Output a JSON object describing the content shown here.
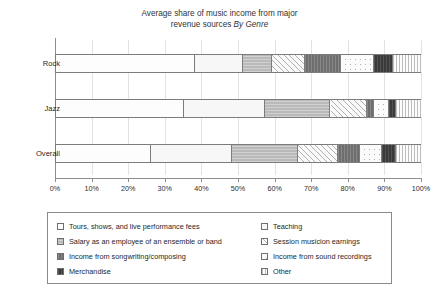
{
  "chart_data": {
    "type": "bar",
    "orientation": "horizontal",
    "stacked": true,
    "normalized_percent": true,
    "title_line1": "Average share of music income from major",
    "title_line2_plain": "revenue sources ",
    "title_line2_italic": "By Genre",
    "xlabel": "",
    "ylabel": "",
    "xlim": [
      0,
      100
    ],
    "xticks": [
      "0%",
      "10%",
      "20%",
      "30%",
      "40%",
      "50%",
      "60%",
      "70%",
      "80%",
      "90%",
      "100%"
    ],
    "xtick_values": [
      0,
      10,
      20,
      30,
      40,
      50,
      60,
      70,
      80,
      90,
      100
    ],
    "grid": true,
    "legend_position": "bottom",
    "categories": [
      "Rock",
      "Jazz",
      "Overall"
    ],
    "series": [
      {
        "name": "Tours, shows, and live performance fees",
        "pattern": "p-white",
        "values": [
          38,
          35,
          26
        ]
      },
      {
        "name": "Teaching",
        "pattern": "p-dots-light",
        "values": [
          13,
          22,
          22
        ]
      },
      {
        "name": "Salary as an employee of an ensemble or band",
        "pattern": "p-gray-mid",
        "values": [
          8,
          18,
          18
        ]
      },
      {
        "name": "Session musicion earnings",
        "pattern": "p-diag",
        "values": [
          9,
          10,
          11
        ]
      },
      {
        "name": "Income from songwriting/composing",
        "pattern": "p-darkgray",
        "values": [
          10,
          2,
          6
        ]
      },
      {
        "name": "Income from sound recordings",
        "pattern": "p-dots-white",
        "values": [
          9,
          4,
          6
        ]
      },
      {
        "name": "Merchandise",
        "pattern": "p-black",
        "values": [
          5,
          2,
          4
        ]
      },
      {
        "name": "Other",
        "pattern": "p-vlines",
        "values": [
          8,
          7,
          7
        ]
      }
    ]
  },
  "legend": {
    "left_column": [
      {
        "label": "Tours, shows, and live performance fees",
        "pattern": "p-white"
      },
      {
        "label": "Salary as an employee of an ensemble or band",
        "pattern": "p-gray-mid"
      },
      {
        "label": "Income from songwriting/composing",
        "pattern": "p-darkgray"
      },
      {
        "label": "Merchandise",
        "pattern": "p-black"
      }
    ],
    "right_column": [
      {
        "label": "Teaching",
        "pattern": "p-dots-light"
      },
      {
        "label": "Session musicion earnings",
        "pattern": "p-diag"
      },
      {
        "label": "Income from sound recordings",
        "pattern": "p-dots-white"
      },
      {
        "label": "Other",
        "pattern": "p-vlines"
      }
    ]
  },
  "colors": {
    "axis": "#8d8d8d",
    "grid": "#e2e2e2",
    "bar_border": "#7c7c7c",
    "text": "#1f1f1f"
  }
}
